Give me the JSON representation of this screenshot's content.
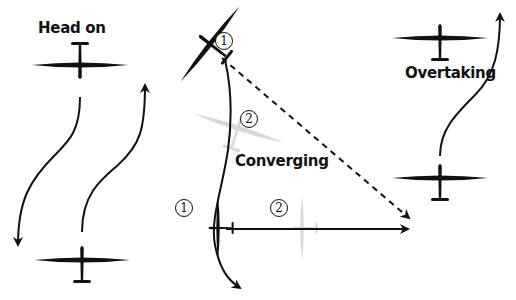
{
  "scenarios": {
    "head_on": {
      "label": "Head on"
    },
    "converging": {
      "label": "Converging",
      "glider_1": "1",
      "glider_2": "2"
    },
    "overtaking": {
      "label": "Overtaking"
    }
  },
  "colors": {
    "primary": "#111111",
    "ghost": "#d9d9d9"
  }
}
